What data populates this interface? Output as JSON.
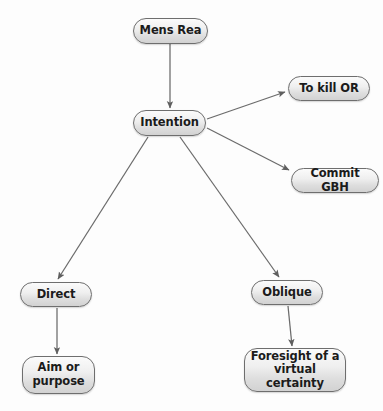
{
  "diagram": {
    "background_color": "#fdfdfd",
    "node_fill_color": "#e8e8e8",
    "node_border_color": "#6e6e6e",
    "node_text_color": "#1b1b1b",
    "edge_color": "#6b6b6b",
    "nodes": [
      {
        "id": "mens-rea",
        "label": "Mens Rea",
        "x": 133,
        "y": 18,
        "w": 75,
        "h": 26
      },
      {
        "id": "intention",
        "label": "Intention",
        "x": 133,
        "y": 110,
        "w": 73,
        "h": 26
      },
      {
        "id": "to-kill-or",
        "label": "To kill OR",
        "x": 288,
        "y": 76,
        "w": 82,
        "h": 25
      },
      {
        "id": "commit-gbh",
        "label": "Commit GBH",
        "x": 291,
        "y": 168,
        "w": 88,
        "h": 25
      },
      {
        "id": "direct",
        "label": "Direct",
        "x": 20,
        "y": 282,
        "w": 72,
        "h": 25
      },
      {
        "id": "oblique",
        "label": "Oblique",
        "x": 251,
        "y": 280,
        "w": 72,
        "h": 25
      },
      {
        "id": "aim-or-purpose",
        "label": "Aim or\npurpose",
        "x": 22,
        "y": 356,
        "w": 73,
        "h": 38
      },
      {
        "id": "foresight",
        "label": "Foresight of a\nvirtual certainty",
        "x": 244,
        "y": 348,
        "w": 102,
        "h": 44
      }
    ],
    "edges": [
      {
        "id": "edge-mens-rea-to-intention",
        "from": "mens-rea",
        "to": "intention",
        "x1": 170,
        "y1": 44,
        "x2": 170,
        "y2": 108
      },
      {
        "id": "edge-intention-to-kill",
        "from": "intention",
        "to": "to-kill-or",
        "x1": 207,
        "y1": 119,
        "x2": 285,
        "y2": 92
      },
      {
        "id": "edge-intention-to-gbh",
        "from": "intention",
        "to": "commit-gbh",
        "x1": 207,
        "y1": 128,
        "x2": 289,
        "y2": 170
      },
      {
        "id": "edge-intention-to-direct",
        "from": "intention",
        "to": "direct",
        "x1": 148,
        "y1": 137,
        "x2": 58,
        "y2": 279
      },
      {
        "id": "edge-intention-to-oblique",
        "from": "intention",
        "to": "oblique",
        "x1": 180,
        "y1": 137,
        "x2": 279,
        "y2": 277
      },
      {
        "id": "edge-direct-to-aim",
        "from": "direct",
        "to": "aim-or-purpose",
        "x1": 57,
        "y1": 308,
        "x2": 57,
        "y2": 354
      },
      {
        "id": "edge-oblique-to-foresight",
        "from": "oblique",
        "to": "foresight",
        "x1": 288,
        "y1": 306,
        "x2": 292,
        "y2": 346
      }
    ]
  }
}
